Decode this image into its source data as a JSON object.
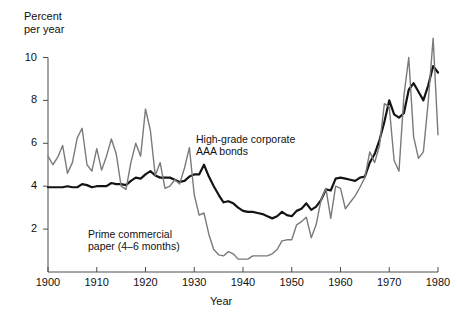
{
  "chart_data": {
    "type": "line",
    "title": "",
    "ylabel": "Percent\nper year",
    "xlabel": "Year",
    "xlim": [
      1900,
      1980
    ],
    "ylim": [
      0,
      10
    ],
    "grid": false,
    "legend_position": "inline-annotation",
    "yticks": [
      2,
      4,
      6,
      8,
      10
    ],
    "ytick_labels": [
      "2",
      "4",
      "6",
      "8",
      "10"
    ],
    "xticks": [
      1900,
      1910,
      1920,
      1930,
      1940,
      1950,
      1960,
      1970,
      1980
    ],
    "xtick_labels": [
      "1900",
      "1910",
      "1920",
      "1930",
      "1940",
      "1950",
      "1960",
      "1970",
      "1980"
    ],
    "annotations": [
      {
        "name": "bonds-label",
        "text": "High-grade corporate\nAAA bonds",
        "x": 1930,
        "y": 6.6
      },
      {
        "name": "paper-label",
        "text": "Prime commercial\npaper (4–6 months)",
        "x": 1910,
        "y": 2.2
      }
    ],
    "series": [
      {
        "name": "High-grade corporate AAA bonds",
        "color": "#141414",
        "width": 2.2,
        "x": [
          1900,
          1901,
          1902,
          1903,
          1904,
          1905,
          1906,
          1907,
          1908,
          1909,
          1910,
          1911,
          1912,
          1913,
          1914,
          1915,
          1916,
          1917,
          1918,
          1919,
          1920,
          1921,
          1922,
          1923,
          1924,
          1925,
          1926,
          1927,
          1928,
          1929,
          1930,
          1931,
          1932,
          1933,
          1934,
          1935,
          1936,
          1937,
          1938,
          1939,
          1940,
          1941,
          1942,
          1943,
          1944,
          1945,
          1946,
          1947,
          1948,
          1949,
          1950,
          1951,
          1952,
          1953,
          1954,
          1955,
          1956,
          1957,
          1958,
          1959,
          1960,
          1961,
          1962,
          1963,
          1964,
          1965,
          1966,
          1967,
          1968,
          1969,
          1970,
          1971,
          1972,
          1973,
          1974,
          1975,
          1976,
          1977,
          1978,
          1979,
          1980
        ],
        "values": [
          3.95,
          3.95,
          3.95,
          3.95,
          4.0,
          3.95,
          3.95,
          4.1,
          4.05,
          3.95,
          4.0,
          4.0,
          4.0,
          4.15,
          4.1,
          4.1,
          4.05,
          4.25,
          4.4,
          4.35,
          4.55,
          4.7,
          4.5,
          4.4,
          4.4,
          4.4,
          4.3,
          4.2,
          4.25,
          4.45,
          4.55,
          4.55,
          5.0,
          4.45,
          4.0,
          3.6,
          3.25,
          3.3,
          3.2,
          3.0,
          2.85,
          2.8,
          2.8,
          2.75,
          2.7,
          2.6,
          2.5,
          2.6,
          2.8,
          2.65,
          2.6,
          2.85,
          2.95,
          3.2,
          2.9,
          3.05,
          3.35,
          3.85,
          3.8,
          4.35,
          4.4,
          4.35,
          4.3,
          4.25,
          4.4,
          4.45,
          5.1,
          5.5,
          6.15,
          7.0,
          8.0,
          7.35,
          7.2,
          7.4,
          8.5,
          8.8,
          8.4,
          8.0,
          8.7,
          9.6,
          9.3
        ]
      },
      {
        "name": "Prime commercial paper (4-6 months)",
        "color": "#7a7a7a",
        "width": 1.4,
        "x": [
          1900,
          1901,
          1902,
          1903,
          1904,
          1905,
          1906,
          1907,
          1908,
          1909,
          1910,
          1911,
          1912,
          1913,
          1914,
          1915,
          1916,
          1917,
          1918,
          1919,
          1920,
          1921,
          1922,
          1923,
          1924,
          1925,
          1926,
          1927,
          1928,
          1929,
          1930,
          1931,
          1932,
          1933,
          1934,
          1935,
          1936,
          1937,
          1938,
          1939,
          1940,
          1941,
          1942,
          1943,
          1944,
          1945,
          1946,
          1947,
          1948,
          1949,
          1950,
          1951,
          1952,
          1953,
          1954,
          1955,
          1956,
          1957,
          1958,
          1959,
          1960,
          1961,
          1962,
          1963,
          1964,
          1965,
          1966,
          1967,
          1968,
          1969,
          1970,
          1971,
          1972,
          1973,
          1974,
          1975,
          1976,
          1977,
          1978,
          1979,
          1980
        ],
        "values": [
          5.4,
          5.0,
          5.35,
          5.9,
          4.6,
          5.1,
          6.25,
          6.7,
          5.0,
          4.7,
          5.75,
          4.75,
          5.4,
          6.2,
          5.5,
          4.0,
          3.85,
          5.1,
          6.0,
          5.4,
          7.6,
          6.6,
          4.5,
          5.1,
          3.9,
          4.0,
          4.3,
          4.1,
          4.85,
          5.8,
          3.6,
          2.65,
          2.75,
          1.75,
          1.05,
          0.8,
          0.75,
          0.95,
          0.85,
          0.6,
          0.6,
          0.6,
          0.75,
          0.75,
          0.75,
          0.75,
          0.85,
          1.05,
          1.45,
          1.5,
          1.5,
          2.2,
          2.35,
          2.55,
          1.6,
          2.2,
          3.35,
          3.9,
          2.5,
          4.0,
          3.9,
          2.95,
          3.25,
          3.55,
          3.95,
          4.4,
          5.6,
          5.1,
          5.9,
          7.85,
          7.7,
          5.2,
          4.7,
          8.2,
          10.0,
          6.3,
          5.3,
          5.6,
          7.95,
          10.9,
          6.4
        ]
      }
    ]
  }
}
